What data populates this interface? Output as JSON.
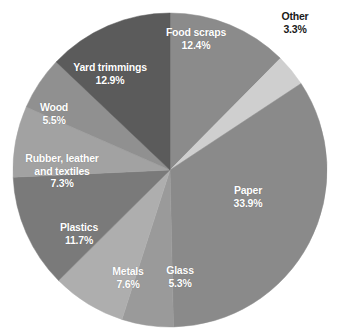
{
  "chart_data": {
    "type": "pie",
    "title": "",
    "subtitle": "",
    "xlabel": "",
    "ylabel": "",
    "legend_position": "none",
    "grid": false,
    "labels_placement": "inside-slices-with-one-external",
    "total_percent": 99.9,
    "start_angle_deg": 0,
    "direction": "clockwise",
    "categories": [
      "Food scraps",
      "Other",
      "Paper",
      "Glass",
      "Metals",
      "Plastics",
      "Rubber, leather and textiles",
      "Wood",
      "Yard trimmings"
    ],
    "values": [
      12.4,
      3.3,
      33.9,
      5.3,
      7.6,
      11.7,
      7.3,
      5.5,
      12.9
    ],
    "value_labels": [
      "12.4%",
      "3.3%",
      "33.9%",
      "5.3%",
      "7.6%",
      "11.7%",
      "7.3%",
      "5.5%",
      "12.9%"
    ],
    "colors": [
      "#8b8b8b",
      "#cfcfcf",
      "#8a8a8a",
      "#9a9a9a",
      "#aeaeae",
      "#7a7a7a",
      "#a2a2a2",
      "#909090",
      "#5b5b5b"
    ],
    "slices": [
      {
        "name": "food-scraps",
        "label": "Food scraps",
        "label_line2": "",
        "value": 12.4,
        "value_label": "12.4%",
        "color": "#8b8b8b",
        "label_color": "#ffffff",
        "external": false
      },
      {
        "name": "other",
        "label": "Other",
        "label_line2": "",
        "value": 3.3,
        "value_label": "3.3%",
        "color": "#cfcfcf",
        "label_color": "#1a1a1a",
        "external": true
      },
      {
        "name": "paper",
        "label": "Paper",
        "label_line2": "",
        "value": 33.9,
        "value_label": "33.9%",
        "color": "#8a8a8a",
        "label_color": "#ffffff",
        "external": false
      },
      {
        "name": "glass",
        "label": "Glass",
        "label_line2": "",
        "value": 5.3,
        "value_label": "5.3%",
        "color": "#9a9a9a",
        "label_color": "#ffffff",
        "external": false
      },
      {
        "name": "metals",
        "label": "Metals",
        "label_line2": "",
        "value": 7.6,
        "value_label": "7.6%",
        "color": "#aeaeae",
        "label_color": "#ffffff",
        "external": false
      },
      {
        "name": "plastics",
        "label": "Plastics",
        "label_line2": "",
        "value": 11.7,
        "value_label": "11.7%",
        "color": "#7a7a7a",
        "label_color": "#ffffff",
        "external": false
      },
      {
        "name": "rubber-leather-textiles",
        "label": "Rubber, leather",
        "label_line2": "and textiles",
        "value": 7.3,
        "value_label": "7.3%",
        "color": "#a2a2a2",
        "label_color": "#ffffff",
        "external": false
      },
      {
        "name": "wood",
        "label": "Wood",
        "label_line2": "",
        "value": 5.5,
        "value_label": "5.5%",
        "color": "#909090",
        "label_color": "#ffffff",
        "external": false
      },
      {
        "name": "yard-trimmings",
        "label": "Yard trimmings",
        "label_line2": "",
        "value": 12.9,
        "value_label": "12.9%",
        "color": "#5b5b5b",
        "label_color": "#ffffff",
        "external": false
      }
    ],
    "geometry": {
      "center_x": 170,
      "center_y": 170,
      "radius": 157
    },
    "background": "#ffffff"
  }
}
